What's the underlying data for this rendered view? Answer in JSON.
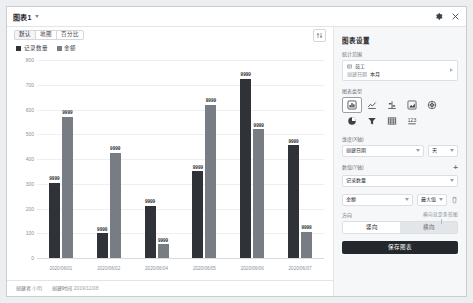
{
  "window": {
    "title": "图表1",
    "caret_icon": "chevron-down-icon",
    "gear_icon": "gear-icon",
    "close_icon": "close-icon"
  },
  "tabs": [
    {
      "label": "默认",
      "active": true
    },
    {
      "label": "地图",
      "active": false
    },
    {
      "label": "百分比",
      "active": false
    }
  ],
  "sort_button": {
    "icon": "sort-icon"
  },
  "footer": {
    "creator_key": "创建者",
    "creator_value": "小明",
    "created_key": "创建时间",
    "created_value": "2019/11/08"
  },
  "chart_data": {
    "type": "bar",
    "title": "",
    "xlabel": "",
    "ylabel": "",
    "ylim": [
      0,
      800
    ],
    "yticks": [
      0,
      100,
      200,
      300,
      400,
      500,
      600,
      700,
      800
    ],
    "grid": true,
    "legend_position": "top-left",
    "categories": [
      "2020/06/01",
      "2020/06/02",
      "2020/06/04",
      "2020/06/05",
      "2020/06/06",
      "2020/06/07"
    ],
    "series": [
      {
        "name": "记录数量",
        "color": "#2f3338",
        "values": [
          305,
          100,
          210,
          350,
          725,
          455
        ]
      },
      {
        "name": "金额",
        "color": "#777d83",
        "values": [
          570,
          425,
          55,
          620,
          520,
          105
        ]
      }
    ],
    "data_labels": [
      [
        "9999",
        "9999",
        "9999",
        "9999",
        "9999",
        "9999"
      ],
      [
        "9999",
        "9999",
        "9999",
        "9999",
        "9999",
        "9999"
      ]
    ]
  },
  "panel": {
    "title": "图表设置",
    "scope": {
      "label": "统计范围",
      "table_icon": "table-icon",
      "table_name": "员工",
      "filter_key": "创建日期",
      "filter_value": "本月",
      "expand_icon": "chevron-right-icon"
    },
    "chart_type": {
      "label": "图表类型",
      "items": [
        {
          "icon": "bar-chart-icon",
          "selected": true
        },
        {
          "icon": "line-chart-icon",
          "selected": false
        },
        {
          "icon": "column-chart-icon",
          "selected": false
        },
        {
          "icon": "area-chart-icon",
          "selected": false
        },
        {
          "icon": "radar-chart-icon",
          "selected": false
        },
        {
          "icon": "pie-chart-icon",
          "selected": false
        },
        {
          "icon": "funnel-chart-icon",
          "selected": false
        },
        {
          "icon": "table-chart-icon",
          "selected": false
        },
        {
          "icon": "number-chart-icon",
          "selected": false
        }
      ]
    },
    "dimension": {
      "label": "维度(X轴)",
      "field_value": "创建日期",
      "unit_value": "天"
    },
    "measure": {
      "label": "数值(Y轴)",
      "add_icon": "plus-icon",
      "rows": [
        {
          "field_value": "记录数量",
          "agg_value": "",
          "has_agg": false,
          "has_delete": false
        },
        {
          "field_value": "金额",
          "agg_value": "最大值",
          "has_agg": true,
          "has_delete": true,
          "delete_icon": "trash-icon"
        }
      ]
    },
    "direction": {
      "label": "方向",
      "hint": "横向就是条形图",
      "options": [
        {
          "label": "竖向",
          "active": true
        },
        {
          "label": "横向",
          "active": false
        }
      ]
    },
    "save_label": "保存图表"
  }
}
